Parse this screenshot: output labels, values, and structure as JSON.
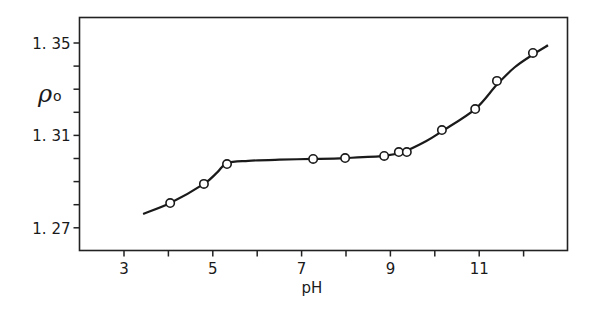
{
  "chart_data": {
    "type": "scatter",
    "title": "",
    "xlabel": "pH",
    "ylabel": "ρ₀",
    "ylabel_symbol": "ρ",
    "ylabel_subscript": "o",
    "xlim": [
      1.7,
      13.0
    ],
    "ylim": [
      1.2665,
      1.3605
    ],
    "x_ticks": [
      3,
      4,
      5,
      6,
      7,
      8,
      9,
      10,
      11,
      12
    ],
    "x_tick_labels": [
      "3",
      "",
      "5",
      "",
      "7",
      "",
      "9",
      "",
      "11",
      ""
    ],
    "y_ticks": [
      1.27,
      1.28,
      1.29,
      1.3,
      1.31,
      1.32,
      1.33,
      1.34,
      1.35
    ],
    "y_tick_labels": [
      "1.27",
      "",
      "",
      "",
      "1.31",
      "",
      "",
      "",
      "1.35"
    ],
    "grid": false,
    "legend": null,
    "series": [
      {
        "name": "measured",
        "marker": "open-circle",
        "x": [
          4.04,
          4.8,
          5.32,
          7.26,
          7.98,
          8.86,
          9.19,
          9.37,
          10.16,
          10.91,
          11.4,
          12.21
        ],
        "y": [
          1.2807,
          1.289,
          1.2976,
          1.2998,
          1.3002,
          1.3011,
          1.3028,
          1.3028,
          1.3123,
          1.3214,
          1.3336,
          1.3457
        ]
      },
      {
        "name": "fitted curve",
        "marker": "line",
        "x": [
          3.43,
          4.04,
          4.8,
          5.1,
          5.32,
          5.8,
          6.5,
          7.26,
          7.98,
          8.86,
          9.28,
          9.8,
          10.16,
          10.91,
          11.4,
          11.8,
          12.21,
          12.55
        ],
        "y": [
          1.276,
          1.2807,
          1.289,
          1.294,
          1.298,
          1.299,
          1.2995,
          1.2998,
          1.3002,
          1.3011,
          1.3028,
          1.3075,
          1.3118,
          1.3214,
          1.332,
          1.3395,
          1.345,
          1.349
        ]
      }
    ]
  }
}
